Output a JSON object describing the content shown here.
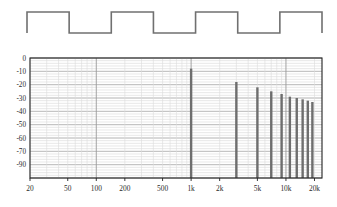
{
  "figure": {
    "title": "",
    "waveform": {
      "name": "square-wave",
      "description": "1 kHz square wave, 3 cycles",
      "cycles": 3,
      "duty_percent": 50,
      "line_color": "#707070",
      "high_level": 1,
      "low_level": -1
    }
  },
  "chart_data": {
    "type": "bar",
    "title": "",
    "xlabel": "",
    "ylabel": "",
    "xscale": "log",
    "grid": true,
    "legend": false,
    "axis_color": "#222222",
    "grid_color": "#c9c9c9",
    "bar_color": "#6e6e6e",
    "xlim": [
      20,
      24000
    ],
    "ylim": [
      -90,
      0
    ],
    "xticks": [
      20,
      50,
      100,
      200,
      500,
      1000,
      2000,
      5000,
      10000,
      20000
    ],
    "xtick_labels": [
      "20",
      "50",
      "100",
      "200",
      "500",
      "1k",
      "2k",
      "5k",
      "10k",
      "20k"
    ],
    "yticks": [
      0,
      -10,
      -20,
      -30,
      -40,
      -50,
      -60,
      -70,
      -90
    ],
    "ytick_labels": [
      "0",
      "-10",
      "-20",
      "-30",
      "-40",
      "-50",
      "-60",
      "-70",
      "-90"
    ],
    "x": [
      1000,
      3000,
      5000,
      7000,
      9000,
      11000,
      13000,
      15000,
      17000,
      19000
    ],
    "values": [
      -8,
      -18,
      -22,
      -25,
      -27,
      -29,
      -30,
      -31,
      -32,
      -33
    ],
    "categories": [
      "1k",
      "3k",
      "5k",
      "7k",
      "9k",
      "11k",
      "13k",
      "15k",
      "17k",
      "19k"
    ],
    "series": [
      {
        "name": "harmonic-spectrum",
        "values": [
          -8,
          -18,
          -22,
          -25,
          -27,
          -29,
          -30,
          -31,
          -32,
          -33
        ]
      }
    ]
  }
}
